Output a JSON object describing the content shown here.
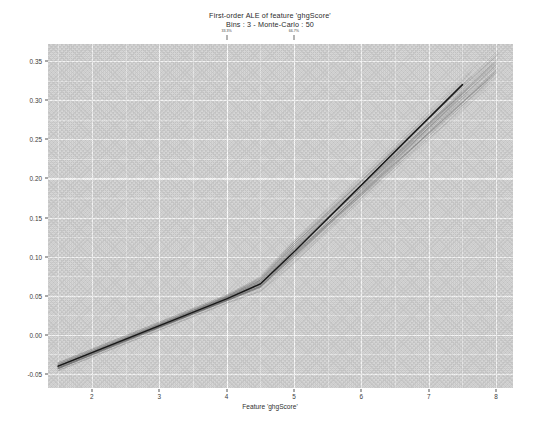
{
  "chart_data": {
    "type": "line",
    "title": "First-order ALE of feature 'ghgScore'",
    "subtitle": "Bins : 3 - Monte-Carlo : 50",
    "xlabel": "Feature 'ghgScore'",
    "ylabel": "",
    "xlim": [
      1.35,
      8.25
    ],
    "ylim": [
      -0.068,
      0.372
    ],
    "grid": true,
    "legend": "none",
    "x_ticks": [
      2,
      3,
      4,
      5,
      6,
      7,
      8
    ],
    "x_tick_labels": [
      "2",
      "3",
      "4",
      "5",
      "6",
      "7",
      "8"
    ],
    "y_ticks": [
      -0.05,
      0.0,
      0.05,
      0.1,
      0.15,
      0.2,
      0.25,
      0.3,
      0.35
    ],
    "y_tick_labels": [
      "-0.05",
      "0.00",
      "0.05",
      "0.10",
      "0.15",
      "0.20",
      "0.25",
      "0.30",
      "0.35"
    ],
    "x_minor_ticks": [
      1.5,
      2.5,
      3.5,
      4.5,
      5.5,
      6.5,
      7.5
    ],
    "y_minor_ticks": [
      -0.025,
      0.025,
      0.075,
      0.125,
      0.175,
      0.225,
      0.275,
      0.325
    ],
    "annotations": [
      {
        "name": "quantile-marker-1",
        "x": 4.0,
        "label": "33.3%"
      },
      {
        "name": "quantile-marker-2",
        "x": 5.0,
        "label": "66.7%"
      }
    ],
    "series": [
      {
        "name": "ALE (main)",
        "color": "#1a1a1a",
        "width": 1.5,
        "x": [
          1.5,
          4.0,
          4.5,
          5.0,
          7.5
        ],
        "values": [
          -0.04,
          0.046,
          0.065,
          0.106,
          0.32
        ]
      }
    ],
    "monte_carlo": {
      "name": "Monte-Carlo replicates",
      "count": 50,
      "color": "#6e6e6e",
      "opacity": 0.3,
      "width": 0.5,
      "description": "50 light grey ALE curves from Monte-Carlo subsamples, tightly bundled at the left and fanning out toward the right end of the feature range",
      "curves": [
        {
          "x": [
            1.5,
            4.0,
            4.5,
            5.0,
            8.0
          ],
          "values": [
            -0.042,
            0.046,
            0.066,
            0.108,
            0.355
          ]
        },
        {
          "x": [
            1.5,
            4.0,
            4.5,
            5.0,
            8.0
          ],
          "values": [
            -0.041,
            0.047,
            0.067,
            0.11,
            0.349
          ]
        },
        {
          "x": [
            1.5,
            4.0,
            4.5,
            5.0,
            8.0
          ],
          "values": [
            -0.039,
            0.045,
            0.064,
            0.105,
            0.344
          ]
        },
        {
          "x": [
            1.5,
            4.0,
            4.5,
            5.0,
            8.0
          ],
          "values": [
            -0.043,
            0.044,
            0.062,
            0.102,
            0.338
          ]
        },
        {
          "x": [
            1.5,
            4.0,
            4.5,
            5.0,
            8.0
          ],
          "values": [
            -0.038,
            0.048,
            0.069,
            0.112,
            0.333
          ]
        },
        {
          "x": [
            1.5,
            4.0,
            4.5,
            5.0,
            7.6
          ],
          "values": [
            -0.04,
            0.046,
            0.065,
            0.106,
            0.327
          ]
        },
        {
          "x": [
            1.5,
            4.0,
            4.5,
            5.0,
            7.6
          ],
          "values": [
            -0.044,
            0.043,
            0.061,
            0.101,
            0.322
          ]
        },
        {
          "x": [
            1.5,
            4.0,
            4.5,
            5.0,
            7.6
          ],
          "values": [
            -0.037,
            0.049,
            0.07,
            0.114,
            0.318
          ]
        },
        {
          "x": [
            1.5,
            4.0,
            4.5,
            5.0,
            8.0
          ],
          "values": [
            -0.042,
            0.045,
            0.063,
            0.104,
            0.346
          ]
        },
        {
          "x": [
            1.5,
            4.0,
            4.5,
            5.0,
            8.0
          ],
          "values": [
            -0.036,
            0.05,
            0.071,
            0.115,
            0.341
          ]
        },
        {
          "x": [
            1.5,
            4.0,
            4.5,
            5.0,
            7.9
          ],
          "values": [
            -0.045,
            0.042,
            0.059,
            0.099,
            0.33
          ]
        },
        {
          "x": [
            1.5,
            4.0,
            4.5,
            5.0,
            7.9
          ],
          "values": [
            -0.039,
            0.047,
            0.068,
            0.109,
            0.336
          ]
        },
        {
          "x": [
            1.5,
            4.0,
            4.5,
            5.0,
            7.5
          ],
          "values": [
            -0.041,
            0.046,
            0.065,
            0.107,
            0.314
          ]
        },
        {
          "x": [
            1.5,
            4.0,
            4.5,
            5.0,
            7.5
          ],
          "values": [
            -0.04,
            0.044,
            0.063,
            0.103,
            0.31
          ]
        },
        {
          "x": [
            1.5,
            4.0,
            4.5,
            5.0,
            8.0
          ],
          "values": [
            -0.043,
            0.048,
            0.067,
            0.111,
            0.352
          ]
        }
      ]
    }
  },
  "plot_geometry": {
    "panel_left_px": 48,
    "panel_top_px": 44,
    "panel_width_px": 465,
    "panel_height_px": 344,
    "panel_fill": "#d5d5d5",
    "grid_major_color": "#f4f4f4",
    "grid_minor_color": "#e4e4e4",
    "figure_background": "#ffffff",
    "tick_text_color": "#3a3a3a"
  }
}
